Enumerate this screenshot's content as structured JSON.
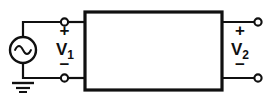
{
  "figure": {
    "type": "circuit-schematic",
    "width": 271,
    "height": 109,
    "background_color": "#ffffff",
    "line_color": "#101010"
  },
  "source": {
    "name": "ac-voltage-source",
    "symbol": "sine-wave",
    "glyph": "∿",
    "center_x": 23,
    "center_y": 50,
    "radius": 13
  },
  "ground": {
    "name": "ground",
    "symbol": "earth-ground",
    "x": 23,
    "y": 78,
    "bars": 3
  },
  "network": {
    "name": "two-port-network-box",
    "label": "",
    "x": 85,
    "y": 12,
    "width": 137,
    "height": 78
  },
  "ports": {
    "input": {
      "label_text": "V",
      "label_sub": "1",
      "plus_sign": "+",
      "minus_sign": "−",
      "terminal_top_y": 22,
      "terminal_bottom_y": 78,
      "terminal_x": 64
    },
    "output": {
      "label_text": "V",
      "label_sub": "2",
      "plus_sign": "+",
      "minus_sign": "−",
      "terminal_top_y": 22,
      "terminal_bottom_y": 78,
      "terminal_x": 258
    }
  }
}
